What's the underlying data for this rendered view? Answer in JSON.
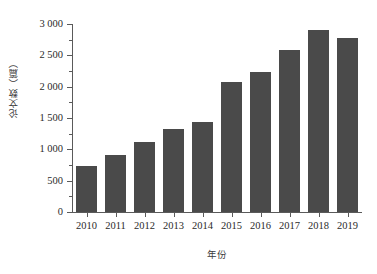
{
  "chart_data": {
    "type": "bar",
    "title": "",
    "subtitle": "",
    "xlabel": "年份",
    "ylabel": "论文数（篇）",
    "categories": [
      "2010",
      "2011",
      "2012",
      "2013",
      "2014",
      "2015",
      "2016",
      "2017",
      "2018",
      "2019"
    ],
    "values": [
      730,
      910,
      1120,
      1320,
      1440,
      2080,
      2240,
      2580,
      2910,
      2770
    ],
    "series": [
      {
        "name": "论文数",
        "values": [
          730,
          910,
          1120,
          1320,
          1440,
          2080,
          2240,
          2580,
          2910,
          2770
        ]
      }
    ],
    "ylim": [
      0,
      3000
    ],
    "ytick_values": [
      0,
      500,
      1000,
      1500,
      2000,
      2500,
      3000
    ],
    "ytick_labels": [
      "0",
      "500",
      "1 000",
      "1 500",
      "2 000",
      "2 500",
      "3 000"
    ],
    "yminor_tick_values": [
      250,
      750,
      1250,
      1750,
      2250,
      2750
    ],
    "grid": false,
    "legend": false,
    "legend_position": "none",
    "bar_color": "#4a4a4a",
    "axis_color": "#5a5a5a",
    "background_color": "#ffffff",
    "annotations": []
  }
}
